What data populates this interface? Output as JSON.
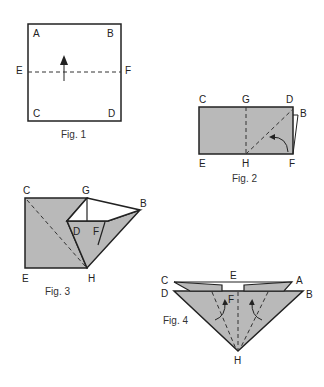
{
  "colors": {
    "paper": "#b9b9b9",
    "line": "#222222",
    "background": "#ffffff"
  },
  "figures": [
    {
      "caption": "Fig. 1",
      "labels": {
        "A": "A",
        "B": "B",
        "C": "C",
        "D": "D",
        "E": "E",
        "F": "F"
      }
    },
    {
      "caption": "Fig. 2",
      "labels": {
        "C": "C",
        "G": "G",
        "D": "D",
        "B": "B",
        "E": "E",
        "H": "H",
        "F": "F"
      }
    },
    {
      "caption": "Fig. 3",
      "labels": {
        "C": "C",
        "G": "G",
        "B": "B",
        "D": "D",
        "F": "F",
        "E": "E",
        "H": "H"
      }
    },
    {
      "caption": "Fig. 4",
      "labels": {
        "C": "C",
        "E": "E",
        "A": "A",
        "D": "D",
        "F": "F",
        "B": "B",
        "H": "H"
      }
    }
  ]
}
